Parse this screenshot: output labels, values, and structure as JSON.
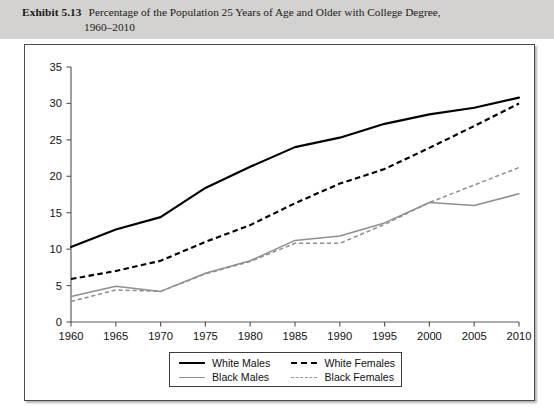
{
  "header": {
    "exhibit_number": "Exhibit 5.13",
    "title_line1": "Percentage of the Population 25 Years of Age and Older with College Degree,",
    "title_line2": "1960–2010",
    "banner_color": "#d3d2d0"
  },
  "legend": {
    "items": [
      {
        "label": "White Males",
        "style": "solid",
        "color": "#000000",
        "swatch": "sw-wm"
      },
      {
        "label": "White Females",
        "style": "dashed",
        "color": "#000000",
        "swatch": "sw-wf"
      },
      {
        "label": "Black Males",
        "style": "solid",
        "color": "#8d9093",
        "swatch": "sw-bm"
      },
      {
        "label": "Black Females",
        "style": "dashed",
        "color": "#8d9093",
        "swatch": "sw-bf"
      }
    ]
  },
  "chart_data": {
    "type": "line",
    "title": "Percentage of the Population 25 Years of Age and Older with College Degree, 1960–2010",
    "xlabel": "",
    "ylabel": "",
    "x": [
      1960,
      1965,
      1970,
      1975,
      1980,
      1985,
      1990,
      1995,
      2000,
      2005,
      2010
    ],
    "xtick_labels": [
      "1960",
      "1965",
      "1970",
      "1975",
      "1980",
      "1985",
      "1990",
      "1995",
      "2000",
      "2005",
      "2010"
    ],
    "ytick_labels": [
      "0",
      "5",
      "10",
      "15",
      "20",
      "25",
      "30",
      "35"
    ],
    "yticks": [
      0,
      5,
      10,
      15,
      20,
      25,
      30,
      35
    ],
    "xlim": [
      1960,
      2010
    ],
    "ylim": [
      0,
      35
    ],
    "grid": false,
    "legend_position": "bottom-center",
    "series": [
      {
        "name": "White Males",
        "color": "#000000",
        "style": "solid",
        "values": [
          10.3,
          12.7,
          14.4,
          18.4,
          21.3,
          24.0,
          25.3,
          27.2,
          28.5,
          29.4,
          30.8
        ]
      },
      {
        "name": "White Females",
        "color": "#000000",
        "style": "dashed",
        "values": [
          5.9,
          7.0,
          8.4,
          11.0,
          13.3,
          16.3,
          19.0,
          21.0,
          23.9,
          26.9,
          30.0
        ]
      },
      {
        "name": "Black Males",
        "color": "#8d9093",
        "style": "solid",
        "values": [
          3.5,
          4.9,
          4.2,
          6.7,
          8.4,
          11.2,
          11.8,
          13.6,
          16.4,
          16.0,
          17.6
        ]
      },
      {
        "name": "Black Females",
        "color": "#8d9093",
        "style": "dashed",
        "values": [
          2.8,
          4.4,
          4.2,
          6.6,
          8.3,
          10.8,
          10.8,
          13.4,
          16.4,
          18.8,
          21.2
        ]
      }
    ]
  }
}
